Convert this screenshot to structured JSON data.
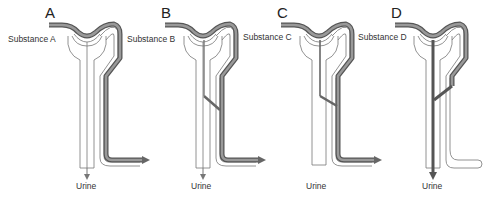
{
  "diagram": {
    "type": "nephron-handling-comparison",
    "panels": [
      {
        "letter": "A",
        "substance_label": "Substance A",
        "output_label": "Urine",
        "filtered": true,
        "reabsorbed": false,
        "secreted": false,
        "excreted_in_urine": "none"
      },
      {
        "letter": "B",
        "substance_label": "Substance B",
        "output_label": "Urine",
        "filtered": true,
        "reabsorbed": "partial",
        "secreted": false,
        "excreted_in_urine": "partial"
      },
      {
        "letter": "C",
        "substance_label": "Substance C",
        "output_label": "Urine",
        "filtered": true,
        "reabsorbed": "complete",
        "secreted": false,
        "excreted_in_urine": "none"
      },
      {
        "letter": "D",
        "substance_label": "Substance D",
        "output_label": "Urine",
        "filtered": true,
        "reabsorbed": false,
        "secreted": true,
        "excreted_in_urine": "complete"
      }
    ],
    "colors": {
      "vessel_fill": "#8a8a8a",
      "vessel_outline": "#555555",
      "tubule_outline": "#666666",
      "background": "#ffffff"
    }
  }
}
